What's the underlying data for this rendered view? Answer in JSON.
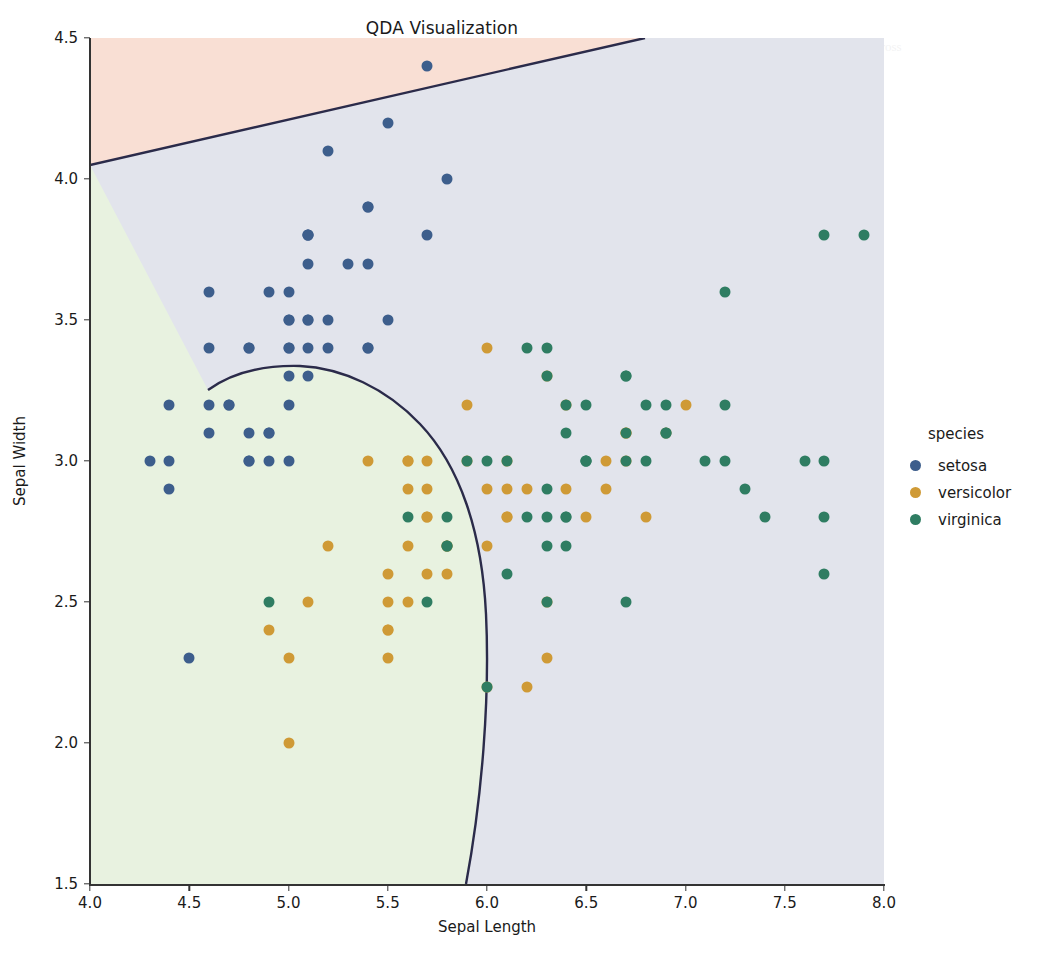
{
  "chart_data": {
    "type": "scatter",
    "title": "QDA Visualization",
    "xlabel": "Sepal Length",
    "ylabel": "Sepal Width",
    "xlim": [
      4.0,
      8.0
    ],
    "ylim": [
      1.5,
      4.5
    ],
    "xticks": [
      "4.0",
      "4.5",
      "5.0",
      "5.5",
      "6.0",
      "6.5",
      "7.0",
      "7.5",
      "8.0"
    ],
    "xtick_values": [
      4.0,
      4.5,
      5.0,
      5.5,
      6.0,
      6.5,
      7.0,
      7.5,
      8.0
    ],
    "yticks": [
      "1.5",
      "2.0",
      "2.5",
      "3.0",
      "3.5",
      "4.0",
      "4.5"
    ],
    "ytick_values": [
      1.5,
      2.0,
      2.5,
      3.0,
      3.5,
      4.0,
      4.5
    ],
    "grid": false,
    "legend_position": "right",
    "legend_title": "species",
    "series": [
      {
        "name": "setosa",
        "color": "#3d5e8c",
        "points": [
          [
            5.1,
            3.5
          ],
          [
            4.9,
            3.0
          ],
          [
            4.7,
            3.2
          ],
          [
            4.6,
            3.1
          ],
          [
            5.0,
            3.6
          ],
          [
            5.4,
            3.9
          ],
          [
            4.6,
            3.4
          ],
          [
            5.0,
            3.4
          ],
          [
            4.4,
            2.9
          ],
          [
            4.9,
            3.1
          ],
          [
            5.4,
            3.7
          ],
          [
            4.8,
            3.4
          ],
          [
            4.8,
            3.0
          ],
          [
            4.3,
            3.0
          ],
          [
            5.8,
            4.0
          ],
          [
            5.7,
            4.4
          ],
          [
            5.4,
            3.9
          ],
          [
            5.1,
            3.5
          ],
          [
            5.7,
            3.8
          ],
          [
            5.1,
            3.8
          ],
          [
            5.4,
            3.4
          ],
          [
            5.1,
            3.7
          ],
          [
            4.6,
            3.6
          ],
          [
            5.1,
            3.3
          ],
          [
            4.8,
            3.4
          ],
          [
            5.0,
            3.0
          ],
          [
            5.0,
            3.4
          ],
          [
            5.2,
            3.5
          ],
          [
            5.2,
            3.4
          ],
          [
            4.7,
            3.2
          ],
          [
            4.8,
            3.1
          ],
          [
            5.4,
            3.4
          ],
          [
            5.2,
            4.1
          ],
          [
            5.5,
            4.2
          ],
          [
            4.9,
            3.1
          ],
          [
            5.0,
            3.2
          ],
          [
            5.5,
            3.5
          ],
          [
            4.9,
            3.6
          ],
          [
            4.4,
            3.0
          ],
          [
            5.1,
            3.4
          ],
          [
            5.0,
            3.5
          ],
          [
            4.5,
            2.3
          ],
          [
            4.4,
            3.2
          ],
          [
            5.0,
            3.5
          ],
          [
            5.1,
            3.8
          ],
          [
            4.8,
            3.0
          ],
          [
            5.1,
            3.8
          ],
          [
            4.6,
            3.2
          ],
          [
            5.3,
            3.7
          ],
          [
            5.0,
            3.3
          ]
        ]
      },
      {
        "name": "versicolor",
        "color": "#cf9a36",
        "points": [
          [
            7.0,
            3.2
          ],
          [
            6.4,
            3.2
          ],
          [
            6.9,
            3.1
          ],
          [
            5.5,
            2.3
          ],
          [
            6.5,
            2.8
          ],
          [
            5.7,
            2.8
          ],
          [
            6.3,
            3.3
          ],
          [
            4.9,
            2.4
          ],
          [
            6.6,
            2.9
          ],
          [
            5.2,
            2.7
          ],
          [
            5.0,
            2.0
          ],
          [
            5.9,
            3.0
          ],
          [
            6.0,
            2.2
          ],
          [
            6.1,
            2.9
          ],
          [
            5.6,
            2.9
          ],
          [
            6.7,
            3.1
          ],
          [
            5.6,
            3.0
          ],
          [
            5.8,
            2.7
          ],
          [
            6.2,
            2.2
          ],
          [
            5.6,
            2.5
          ],
          [
            5.9,
            3.2
          ],
          [
            6.1,
            2.8
          ],
          [
            6.3,
            2.5
          ],
          [
            6.1,
            2.8
          ],
          [
            6.4,
            2.9
          ],
          [
            6.6,
            3.0
          ],
          [
            6.8,
            2.8
          ],
          [
            6.7,
            3.0
          ],
          [
            6.0,
            2.9
          ],
          [
            5.7,
            2.6
          ],
          [
            5.5,
            2.4
          ],
          [
            5.5,
            2.4
          ],
          [
            5.8,
            2.7
          ],
          [
            6.0,
            2.7
          ],
          [
            5.4,
            3.0
          ],
          [
            6.0,
            3.4
          ],
          [
            6.7,
            3.1
          ],
          [
            6.3,
            2.3
          ],
          [
            5.6,
            3.0
          ],
          [
            5.5,
            2.5
          ],
          [
            5.5,
            2.6
          ],
          [
            6.1,
            3.0
          ],
          [
            5.8,
            2.6
          ],
          [
            5.0,
            2.3
          ],
          [
            5.6,
            2.7
          ],
          [
            5.7,
            3.0
          ],
          [
            5.7,
            2.9
          ],
          [
            6.2,
            2.9
          ],
          [
            5.1,
            2.5
          ],
          [
            5.7,
            2.8
          ]
        ]
      },
      {
        "name": "virginica",
        "color": "#2f7d62",
        "points": [
          [
            6.3,
            3.3
          ],
          [
            5.8,
            2.7
          ],
          [
            7.1,
            3.0
          ],
          [
            6.3,
            2.9
          ],
          [
            6.5,
            3.0
          ],
          [
            7.6,
            3.0
          ],
          [
            4.9,
            2.5
          ],
          [
            7.3,
            2.9
          ],
          [
            6.7,
            2.5
          ],
          [
            7.2,
            3.6
          ],
          [
            6.5,
            3.2
          ],
          [
            6.4,
            2.7
          ],
          [
            6.8,
            3.0
          ],
          [
            5.7,
            2.5
          ],
          [
            5.8,
            2.8
          ],
          [
            6.4,
            3.2
          ],
          [
            6.5,
            3.0
          ],
          [
            7.7,
            3.8
          ],
          [
            7.7,
            2.6
          ],
          [
            6.0,
            2.2
          ],
          [
            6.9,
            3.2
          ],
          [
            5.6,
            2.8
          ],
          [
            7.7,
            2.8
          ],
          [
            6.3,
            2.7
          ],
          [
            6.7,
            3.3
          ],
          [
            7.2,
            3.2
          ],
          [
            6.2,
            2.8
          ],
          [
            6.1,
            3.0
          ],
          [
            6.4,
            2.8
          ],
          [
            7.2,
            3.0
          ],
          [
            7.4,
            2.8
          ],
          [
            7.9,
            3.8
          ],
          [
            6.4,
            2.8
          ],
          [
            6.3,
            2.8
          ],
          [
            6.1,
            2.6
          ],
          [
            7.7,
            3.0
          ],
          [
            6.3,
            3.4
          ],
          [
            6.4,
            3.1
          ],
          [
            6.0,
            3.0
          ],
          [
            6.9,
            3.1
          ],
          [
            6.7,
            3.1
          ],
          [
            6.9,
            3.1
          ],
          [
            5.8,
            2.7
          ],
          [
            6.8,
            3.2
          ],
          [
            6.7,
            3.3
          ],
          [
            6.7,
            3.0
          ],
          [
            6.3,
            2.5
          ],
          [
            6.5,
            3.0
          ],
          [
            6.2,
            3.4
          ],
          [
            5.9,
            3.0
          ]
        ]
      }
    ],
    "decision_regions": [
      {
        "class": "setosa",
        "fill": "#f9dfd4"
      },
      {
        "class": "versicolor",
        "fill": "#e8f2e0"
      },
      {
        "class": "virginica",
        "fill": "#e2e4ec"
      }
    ],
    "boundary_color": "#2b2b4a",
    "annotations": []
  },
  "legend": {
    "title": "species",
    "entries": [
      {
        "label": "setosa",
        "color": "#3d5e8c"
      },
      {
        "label": "versicolor",
        "color": "#cf9a36"
      },
      {
        "label": "virginica",
        "color": "#2f7d62"
      }
    ]
  },
  "watermark_text": "the scanned page shows a faint impression of underlying printed body text which bleeds through the figure background across several lines of the original document page"
}
